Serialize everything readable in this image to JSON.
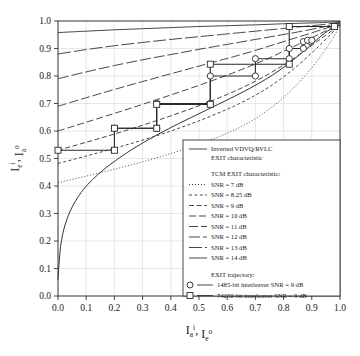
{
  "chart_data": {
    "type": "line",
    "title": "",
    "xlabel": "I_a^i , I_e^o",
    "ylabel": "I_e^i , I_a^o",
    "xlabel_parts": {
      "main1": "I",
      "sub1": "a",
      "sup1": "i",
      "sep": ",",
      "main2": "I",
      "sub2": "e",
      "sup2": "o"
    },
    "ylabel_parts": {
      "main1": "I",
      "sub1": "e",
      "sup1": "i",
      "sep": ",",
      "main2": "I",
      "sub2": "a",
      "sup2": "o"
    },
    "xlim": [
      0.0,
      1.0
    ],
    "ylim": [
      0.0,
      1.0
    ],
    "xticks": [
      "0.0",
      "0.1",
      "0.2",
      "0.3",
      "0.4",
      "0.5",
      "0.6",
      "0.7",
      "0.8",
      "0.9",
      "1.0"
    ],
    "yticks": [
      "0.0",
      "0.1",
      "0.2",
      "0.3",
      "0.4",
      "0.5",
      "0.6",
      "0.7",
      "0.8",
      "0.9",
      "1.0"
    ],
    "grid": true,
    "legend_position": "lower-right-inside",
    "series": [
      {
        "name": "Inverted VDVQ/RVLC EXIT characteristic",
        "style": "solid",
        "points": [
          [
            0.0,
            0.06
          ],
          [
            0.004,
            0.12
          ],
          [
            0.008,
            0.17
          ],
          [
            0.013,
            0.205
          ],
          [
            0.018,
            0.232
          ],
          [
            0.025,
            0.258
          ],
          [
            0.033,
            0.283
          ],
          [
            0.042,
            0.306
          ],
          [
            0.052,
            0.327
          ],
          [
            0.063,
            0.347
          ],
          [
            0.075,
            0.366
          ],
          [
            0.09,
            0.387
          ],
          [
            0.105,
            0.405
          ],
          [
            0.122,
            0.423
          ],
          [
            0.14,
            0.44
          ],
          [
            0.16,
            0.458
          ],
          [
            0.182,
            0.476
          ],
          [
            0.205,
            0.493
          ],
          [
            0.23,
            0.511
          ],
          [
            0.258,
            0.53
          ],
          [
            0.288,
            0.549
          ],
          [
            0.32,
            0.568
          ],
          [
            0.355,
            0.588
          ],
          [
            0.392,
            0.608
          ],
          [
            0.432,
            0.629
          ],
          [
            0.474,
            0.65
          ],
          [
            0.518,
            0.672
          ],
          [
            0.564,
            0.695
          ],
          [
            0.612,
            0.719
          ],
          [
            0.662,
            0.745
          ],
          [
            0.712,
            0.773
          ],
          [
            0.76,
            0.803
          ],
          [
            0.806,
            0.836
          ],
          [
            0.848,
            0.87
          ],
          [
            0.886,
            0.903
          ],
          [
            0.918,
            0.932
          ],
          [
            0.945,
            0.955
          ],
          [
            0.966,
            0.97
          ],
          [
            0.982,
            0.979
          ],
          [
            1.0,
            0.984
          ]
        ]
      },
      {
        "name": "SNR = 7 dB",
        "label": "SNR = 7 dB",
        "group": "TCM EXIT characteristic",
        "style": "dotted",
        "dash": "1,2",
        "points": [
          [
            0.0,
            0.412
          ],
          [
            0.1,
            0.436
          ],
          [
            0.2,
            0.461
          ],
          [
            0.3,
            0.488
          ],
          [
            0.4,
            0.518
          ],
          [
            0.5,
            0.552
          ],
          [
            0.6,
            0.592
          ],
          [
            0.65,
            0.616
          ],
          [
            0.7,
            0.645
          ],
          [
            0.75,
            0.68
          ],
          [
            0.8,
            0.722
          ],
          [
            0.85,
            0.772
          ],
          [
            0.9,
            0.83
          ],
          [
            0.94,
            0.885
          ],
          [
            0.97,
            0.93
          ],
          [
            0.99,
            0.965
          ],
          [
            1.0,
            0.985
          ]
        ]
      },
      {
        "name": "SNR = 8.25 dB",
        "label": "SNR = 8.25 dB",
        "group": "TCM EXIT characteristic",
        "style": "dashed-fine",
        "dash": "3,2.4",
        "points": [
          [
            0.0,
            0.482
          ],
          [
            0.1,
            0.509
          ],
          [
            0.2,
            0.537
          ],
          [
            0.3,
            0.567
          ],
          [
            0.4,
            0.6
          ],
          [
            0.5,
            0.637
          ],
          [
            0.6,
            0.679
          ],
          [
            0.65,
            0.703
          ],
          [
            0.7,
            0.73
          ],
          [
            0.75,
            0.761
          ],
          [
            0.8,
            0.797
          ],
          [
            0.85,
            0.838
          ],
          [
            0.9,
            0.884
          ],
          [
            0.94,
            0.924
          ],
          [
            0.97,
            0.955
          ],
          [
            0.99,
            0.976
          ],
          [
            1.0,
            0.988
          ]
        ]
      },
      {
        "name": "SNR = 9 dB",
        "label": "SNR = 9 dB",
        "group": "TCM EXIT characteristic",
        "style": "dashed",
        "dash": "5,2.6",
        "points": [
          [
            0.0,
            0.53
          ],
          [
            0.1,
            0.559
          ],
          [
            0.2,
            0.589
          ],
          [
            0.3,
            0.621
          ],
          [
            0.4,
            0.655
          ],
          [
            0.5,
            0.692
          ],
          [
            0.6,
            0.733
          ],
          [
            0.65,
            0.756
          ],
          [
            0.7,
            0.781
          ],
          [
            0.75,
            0.809
          ],
          [
            0.8,
            0.84
          ],
          [
            0.85,
            0.874
          ],
          [
            0.9,
            0.911
          ],
          [
            0.94,
            0.941
          ],
          [
            0.97,
            0.964
          ],
          [
            0.99,
            0.98
          ],
          [
            1.0,
            0.99
          ]
        ]
      },
      {
        "name": "SNR = 10 dB",
        "label": "SNR = 10 dB",
        "group": "TCM EXIT characteristic",
        "style": "dashed-med",
        "dash": "7,3",
        "points": [
          [
            0.0,
            0.6
          ],
          [
            0.1,
            0.632
          ],
          [
            0.2,
            0.664
          ],
          [
            0.3,
            0.697
          ],
          [
            0.4,
            0.731
          ],
          [
            0.5,
            0.766
          ],
          [
            0.6,
            0.803
          ],
          [
            0.65,
            0.823
          ],
          [
            0.7,
            0.844
          ],
          [
            0.75,
            0.866
          ],
          [
            0.8,
            0.89
          ],
          [
            0.85,
            0.914
          ],
          [
            0.9,
            0.939
          ],
          [
            0.94,
            0.959
          ],
          [
            0.97,
            0.974
          ],
          [
            0.99,
            0.985
          ],
          [
            1.0,
            0.992
          ]
        ]
      },
      {
        "name": "SNR = 11 dB",
        "label": "SNR = 11 dB",
        "group": "TCM EXIT characteristic",
        "style": "dashed-long",
        "dash": "9,3",
        "points": [
          [
            0.0,
            0.69
          ],
          [
            0.1,
            0.721
          ],
          [
            0.2,
            0.751
          ],
          [
            0.3,
            0.78
          ],
          [
            0.4,
            0.808
          ],
          [
            0.5,
            0.836
          ],
          [
            0.6,
            0.864
          ],
          [
            0.65,
            0.878
          ],
          [
            0.7,
            0.893
          ],
          [
            0.75,
            0.909
          ],
          [
            0.8,
            0.925
          ],
          [
            0.85,
            0.941
          ],
          [
            0.9,
            0.957
          ],
          [
            0.94,
            0.97
          ],
          [
            0.97,
            0.98
          ],
          [
            0.99,
            0.988
          ],
          [
            1.0,
            0.993
          ]
        ]
      },
      {
        "name": "SNR = 12 dB",
        "label": "SNR = 12 dB",
        "group": "TCM EXIT characteristic",
        "style": "dashed-longer",
        "dash": "11,3",
        "points": [
          [
            0.0,
            0.79
          ],
          [
            0.1,
            0.815
          ],
          [
            0.2,
            0.838
          ],
          [
            0.3,
            0.859
          ],
          [
            0.4,
            0.878
          ],
          [
            0.5,
            0.897
          ],
          [
            0.6,
            0.915
          ],
          [
            0.65,
            0.924
          ],
          [
            0.7,
            0.933
          ],
          [
            0.75,
            0.942
          ],
          [
            0.8,
            0.951
          ],
          [
            0.85,
            0.96
          ],
          [
            0.9,
            0.97
          ],
          [
            0.94,
            0.978
          ],
          [
            0.97,
            0.985
          ],
          [
            0.99,
            0.991
          ],
          [
            1.0,
            0.995
          ]
        ]
      },
      {
        "name": "SNR = 13 dB",
        "label": "SNR = 13 dB",
        "group": "TCM EXIT characteristic",
        "style": "dashed-vlong",
        "dash": "13,3",
        "points": [
          [
            0.0,
            0.88
          ],
          [
            0.1,
            0.896
          ],
          [
            0.2,
            0.91
          ],
          [
            0.3,
            0.922
          ],
          [
            0.4,
            0.933
          ],
          [
            0.5,
            0.943
          ],
          [
            0.6,
            0.953
          ],
          [
            0.65,
            0.958
          ],
          [
            0.7,
            0.963
          ],
          [
            0.75,
            0.968
          ],
          [
            0.8,
            0.973
          ],
          [
            0.85,
            0.978
          ],
          [
            0.9,
            0.983
          ],
          [
            0.94,
            0.987
          ],
          [
            0.97,
            0.991
          ],
          [
            0.99,
            0.994
          ],
          [
            1.0,
            0.997
          ]
        ]
      },
      {
        "name": "SNR = 14 dB",
        "label": "SNR = 14 dB",
        "group": "TCM EXIT characteristic",
        "style": "solid-thin",
        "dash": "",
        "points": [
          [
            0.0,
            0.958
          ],
          [
            0.1,
            0.963
          ],
          [
            0.2,
            0.968
          ],
          [
            0.3,
            0.972
          ],
          [
            0.4,
            0.976
          ],
          [
            0.5,
            0.98
          ],
          [
            0.6,
            0.983
          ],
          [
            0.7,
            0.986
          ],
          [
            0.8,
            0.99
          ],
          [
            0.9,
            0.993
          ],
          [
            0.95,
            0.995
          ],
          [
            1.0,
            0.998
          ]
        ]
      }
    ],
    "trajectories": [
      {
        "name": "1485-bit interleaver SNR = 9 dB",
        "marker": "circle",
        "points": [
          [
            0.2,
            0.61
          ],
          [
            0.35,
            0.61
          ],
          [
            0.35,
            0.7
          ],
          [
            0.54,
            0.7
          ],
          [
            0.54,
            0.8
          ],
          [
            0.7,
            0.8
          ],
          [
            0.7,
            0.863
          ],
          [
            0.82,
            0.863
          ],
          [
            0.82,
            0.9
          ],
          [
            0.87,
            0.9
          ],
          [
            0.87,
            0.925
          ],
          [
            0.895,
            0.925
          ],
          [
            0.885,
            0.93
          ],
          [
            0.9,
            0.93
          ]
        ]
      },
      {
        "name": "74250-bit interleaver SNR = 9 dB",
        "marker": "square",
        "points": [
          [
            0.0,
            0.53
          ],
          [
            0.2,
            0.53
          ],
          [
            0.2,
            0.61
          ],
          [
            0.35,
            0.61
          ],
          [
            0.35,
            0.697
          ],
          [
            0.54,
            0.697
          ],
          [
            0.54,
            0.843
          ],
          [
            0.82,
            0.843
          ],
          [
            0.82,
            0.98
          ],
          [
            0.98,
            0.98
          ]
        ]
      }
    ]
  },
  "legend": {
    "entry_main": {
      "line1": "Inverted VDVQ/RVLC",
      "line2": "EXIT characteristic"
    },
    "group_title": "TCM EXIT characteristic:",
    "snr_entries": [
      "SNR = 7 dB",
      "SNR = 8.25 dB",
      "SNR = 9 dB",
      "SNR = 10 dB",
      "SNR = 11 dB",
      "SNR = 12 dB",
      "SNR = 13 dB",
      "SNR = 14 dB"
    ],
    "trajectory_title": "EXIT trajectory:",
    "trajectory_entries": [
      {
        "marker": "circle",
        "label": "1485-bit interleaver SNR = 9 dB"
      },
      {
        "marker": "square",
        "label": "74250-bit interleaver SNR = 9 dB"
      }
    ]
  },
  "colors": {
    "line": "#333333",
    "grid": "#cfcfcf",
    "background": "#ffffff",
    "marker_fill": "#ffffff"
  }
}
